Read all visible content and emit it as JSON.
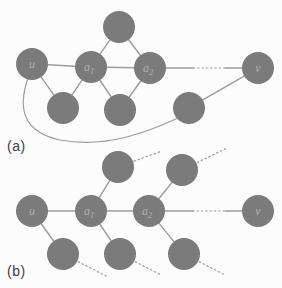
{
  "figure": {
    "background": "#fcfcfc",
    "node_fill": "#7b7b7b",
    "node_label_color": "#b0b0b0",
    "edge_color": "#9c9c9c",
    "caption_color": "#3d3d3d",
    "node_radius": 16,
    "diagrams": [
      {
        "id": "a",
        "caption": "(a)",
        "nodes": [
          {
            "id": "u",
            "label": "u",
            "x": 32,
            "y": 64
          },
          {
            "id": "a1",
            "label": "a",
            "sub": "1",
            "x": 91,
            "y": 67
          },
          {
            "id": "a2",
            "label": "a",
            "sub": "2",
            "x": 150,
            "y": 68
          },
          {
            "id": "v",
            "label": "v",
            "x": 258,
            "y": 68
          },
          {
            "id": "t",
            "x": 119,
            "y": 27
          },
          {
            "id": "b1",
            "x": 63,
            "y": 108
          },
          {
            "id": "b2",
            "x": 120,
            "y": 110
          },
          {
            "id": "b3",
            "x": 189,
            "y": 108
          }
        ],
        "edges": [
          {
            "from": "u",
            "to": "a1",
            "style": "solid"
          },
          {
            "from": "a1",
            "to": "a2",
            "style": "solid"
          },
          {
            "from": "a2",
            "to": "v",
            "style": "mid-dotted"
          },
          {
            "from": "t",
            "to": "a1",
            "style": "solid"
          },
          {
            "from": "t",
            "to": "a2",
            "style": "solid"
          },
          {
            "from": "u",
            "to": "b1",
            "style": "solid"
          },
          {
            "from": "a1",
            "to": "b1",
            "style": "solid"
          },
          {
            "from": "a1",
            "to": "b2",
            "style": "solid"
          },
          {
            "from": "a2",
            "to": "b2",
            "style": "solid"
          },
          {
            "from": "b3",
            "to": "v",
            "style": "solid"
          }
        ],
        "curves": [
          {
            "from": "u",
            "to": "b3",
            "path": "M 28 78 C 17 110 24 132 60 140 C 106 149 150 131 178 118"
          }
        ],
        "stubs": []
      },
      {
        "id": "b",
        "caption": "(b)",
        "nodes": [
          {
            "id": "u",
            "label": "u",
            "x": 32,
            "y": 211
          },
          {
            "id": "a1",
            "label": "a",
            "sub": "1",
            "x": 91,
            "y": 211
          },
          {
            "id": "a2",
            "label": "a",
            "sub": "2",
            "x": 149,
            "y": 211
          },
          {
            "id": "v",
            "label": "v",
            "x": 258,
            "y": 211
          },
          {
            "id": "t1",
            "x": 118,
            "y": 167
          },
          {
            "id": "t2",
            "x": 182,
            "y": 170
          },
          {
            "id": "b1",
            "x": 63,
            "y": 254
          },
          {
            "id": "b2",
            "x": 120,
            "y": 254
          },
          {
            "id": "b3",
            "x": 184,
            "y": 254
          }
        ],
        "edges": [
          {
            "from": "u",
            "to": "a1",
            "style": "solid"
          },
          {
            "from": "a1",
            "to": "a2",
            "style": "solid"
          },
          {
            "from": "a2",
            "to": "v",
            "style": "mid-dotted"
          },
          {
            "from": "a1",
            "to": "t1",
            "style": "solid"
          },
          {
            "from": "a2",
            "to": "t2",
            "style": "solid"
          },
          {
            "from": "u",
            "to": "b1",
            "style": "solid"
          },
          {
            "from": "a1",
            "to": "b2",
            "style": "solid"
          },
          {
            "from": "a2",
            "to": "b3",
            "style": "solid"
          }
        ],
        "curves": [],
        "stubs": [
          {
            "from": "t1",
            "angle": -20,
            "len": 29
          },
          {
            "from": "t2",
            "angle": -26,
            "len": 32
          },
          {
            "from": "b1",
            "angle": 27,
            "len": 32
          },
          {
            "from": "b2",
            "angle": 27,
            "len": 30
          },
          {
            "from": "b3",
            "angle": 27,
            "len": 27
          }
        ]
      }
    ]
  }
}
